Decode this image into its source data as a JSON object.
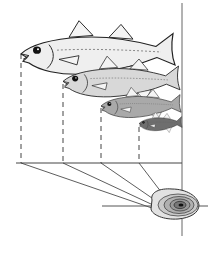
{
  "diagram": {
    "colors": {
      "background": "#ffffff",
      "line": "#333333",
      "fish_light": "#eeeeee",
      "fish_mid": "#c8c8c8",
      "fish_dark": "#8a8a8a",
      "fish_darkest": "#5a5a5a",
      "otolith_outer": "#d9d9d9",
      "otolith_inner": "#555555"
    },
    "fish": [
      {
        "name": "fish-age-4",
        "snout_x": 21,
        "snout_y": 52,
        "tail_x": 182,
        "scale": 1.0
      },
      {
        "name": "fish-age-3",
        "snout_x": 63,
        "snout_y": 80,
        "tail_x": 182,
        "scale": 0.74
      },
      {
        "name": "fish-age-2",
        "snout_x": 101,
        "snout_y": 105,
        "tail_x": 182,
        "scale": 0.5
      },
      {
        "name": "fish-age-1",
        "snout_x": 139,
        "snout_y": 122,
        "tail_x": 182,
        "scale": 0.27
      }
    ],
    "baseline_y": 163,
    "drop_lines_x": [
      21,
      63,
      101,
      139
    ],
    "convergence_point": {
      "x": 181,
      "y": 218
    },
    "otolith": {
      "cx": 178,
      "cy": 205,
      "rx": 25,
      "ry": 14,
      "rings": 6
    }
  }
}
